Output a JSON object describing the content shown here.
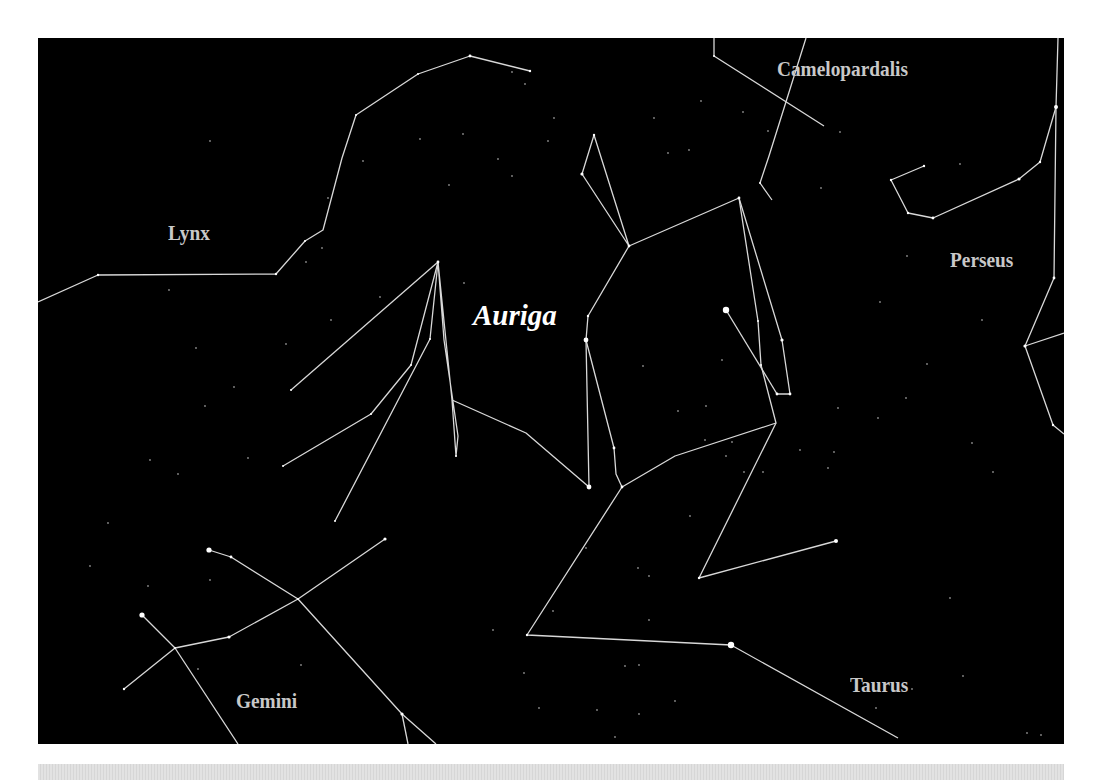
{
  "figure": {
    "title": "Auriga",
    "background_color": "#000000",
    "line_color": "#d8d8d8",
    "label_color": "#c8c8c8",
    "main_label_color": "#ffffff"
  },
  "labels": {
    "auriga": "Auriga",
    "lynx": "Lynx",
    "camelopardalis": "Camelopardalis",
    "perseus": "Perseus",
    "gemini": "Gemini",
    "taurus": "Taurus"
  },
  "label_positions": {
    "auriga": {
      "x": 435,
      "y": 263
    },
    "lynx": {
      "x": 130,
      "y": 185
    },
    "camelopardalis": {
      "x": 739,
      "y": 21
    },
    "perseus": {
      "x": 912,
      "y": 212
    },
    "gemini": {
      "x": 198,
      "y": 653
    },
    "taurus": {
      "x": 812,
      "y": 637
    }
  },
  "constellations": [
    {
      "name": "Lynx",
      "lines": [
        [
          [
            0,
            264
          ],
          [
            60,
            237
          ],
          [
            238,
            236
          ],
          [
            267,
            203
          ],
          [
            285,
            192
          ],
          [
            304,
            120
          ],
          [
            318,
            77
          ],
          [
            380,
            36
          ],
          [
            432,
            18
          ],
          [
            492,
            33
          ]
        ]
      ],
      "stars": [
        [
          60,
          237,
          1.2
        ],
        [
          238,
          236,
          1.2
        ],
        [
          267,
          203,
          1.0
        ],
        [
          318,
          77,
          1.0
        ],
        [
          380,
          36,
          1.0
        ],
        [
          432,
          18,
          1.4
        ],
        [
          492,
          33,
          1.2
        ]
      ]
    },
    {
      "name": "Auriga",
      "lines": [
        [
          [
            550,
            278
          ],
          [
            591,
            208
          ],
          [
            701,
            160
          ],
          [
            720,
            283
          ],
          [
            723,
            327
          ],
          [
            738,
            385
          ],
          [
            637,
            418
          ],
          [
            584,
            449
          ]
        ],
        [
          [
            591,
            208
          ],
          [
            556,
            97
          ],
          [
            544,
            136
          ],
          [
            591,
            208
          ]
        ],
        [
          [
            701,
            160
          ],
          [
            744,
            302
          ],
          [
            752,
            356
          ],
          [
            739,
            356
          ]
        ],
        [
          [
            688,
            272
          ],
          [
            739,
            356
          ]
        ],
        [
          [
            550,
            278
          ],
          [
            548,
            302
          ],
          [
            551,
            449
          ]
        ],
        [
          [
            548,
            302
          ],
          [
            576,
            410
          ],
          [
            578,
            436
          ],
          [
            584,
            449
          ]
        ],
        [
          [
            584,
            449
          ],
          [
            489,
            597
          ],
          [
            693,
            607
          ],
          [
            860,
            700
          ]
        ],
        [
          [
            738,
            385
          ],
          [
            661,
            540
          ],
          [
            798,
            503
          ]
        ]
      ],
      "stars": [
        [
          688,
          272,
          3.2
        ],
        [
          548,
          302,
          2.4
        ],
        [
          551,
          449,
          2.4
        ],
        [
          693,
          607,
          3.2
        ],
        [
          798,
          503,
          2.0
        ],
        [
          556,
          97,
          1.2
        ],
        [
          544,
          136,
          1.6
        ],
        [
          591,
          208,
          1.4
        ],
        [
          701,
          160,
          1.4
        ],
        [
          744,
          302,
          1.6
        ],
        [
          752,
          356,
          1.4
        ],
        [
          739,
          356,
          1.4
        ],
        [
          576,
          410,
          1.4
        ],
        [
          584,
          449,
          1.4
        ],
        [
          489,
          597,
          1.2
        ],
        [
          661,
          540,
          1.2
        ],
        [
          550,
          278,
          1.2
        ],
        [
          720,
          283,
          1.0
        ],
        [
          723,
          327,
          1.0
        ]
      ]
    },
    {
      "name": "Auriga-west-rays",
      "lines": [
        [
          [
            400,
            224
          ],
          [
            253,
            352
          ]
        ],
        [
          [
            400,
            224
          ],
          [
            373,
            327
          ],
          [
            333,
            376
          ],
          [
            245,
            428
          ]
        ],
        [
          [
            400,
            224
          ],
          [
            392,
            301
          ],
          [
            297,
            483
          ]
        ],
        [
          [
            400,
            224
          ],
          [
            414,
            362
          ],
          [
            418,
            418
          ],
          [
            420,
            398
          ],
          [
            406,
            302
          ],
          [
            400,
            224
          ]
        ],
        [
          [
            414,
            362
          ],
          [
            488,
            395
          ],
          [
            551,
            449
          ]
        ]
      ],
      "stars": [
        [
          400,
          224,
          1.4
        ],
        [
          253,
          352,
          1.0
        ],
        [
          245,
          428,
          1.0
        ],
        [
          297,
          483,
          1.0
        ],
        [
          373,
          327,
          1.0
        ],
        [
          333,
          376,
          1.0
        ],
        [
          392,
          301,
          1.0
        ],
        [
          418,
          418,
          1.0
        ]
      ]
    },
    {
      "name": "Camelopardalis",
      "lines": [
        [
          [
            676,
            0
          ],
          [
            676,
            18
          ],
          [
            786,
            88
          ]
        ],
        [
          [
            768,
            0
          ],
          [
            731,
            118
          ],
          [
            722,
            145
          ],
          [
            734,
            162
          ]
        ]
      ],
      "stars": [
        [
          676,
          18,
          1.0
        ],
        [
          722,
          145,
          1.0
        ]
      ]
    },
    {
      "name": "Perseus",
      "lines": [
        [
          [
            1020,
            0
          ],
          [
            1018,
            69
          ],
          [
            1002,
            124
          ],
          [
            981,
            141
          ],
          [
            895,
            180
          ],
          [
            870,
            175
          ],
          [
            853,
            142
          ],
          [
            886,
            128
          ]
        ],
        [
          [
            1018,
            69
          ],
          [
            1016,
            240
          ],
          [
            987,
            308
          ],
          [
            1026,
            295
          ]
        ],
        [
          [
            987,
            308
          ],
          [
            1015,
            387
          ],
          [
            1026,
            396
          ]
        ]
      ],
      "stars": [
        [
          1018,
          69,
          2.0
        ],
        [
          981,
          141,
          1.6
        ],
        [
          1002,
          124,
          1.2
        ],
        [
          895,
          180,
          1.4
        ],
        [
          870,
          175,
          1.2
        ],
        [
          853,
          142,
          1.2
        ],
        [
          886,
          128,
          1.2
        ],
        [
          1016,
          240,
          1.4
        ],
        [
          987,
          308,
          1.6
        ],
        [
          1015,
          387,
          1.2
        ]
      ]
    },
    {
      "name": "Gemini",
      "lines": [
        [
          [
            171,
            512
          ],
          [
            193,
            519
          ],
          [
            260,
            561
          ],
          [
            347,
            501
          ]
        ],
        [
          [
            104,
            577
          ],
          [
            137,
            610
          ],
          [
            191,
            599
          ],
          [
            260,
            561
          ],
          [
            364,
            676
          ],
          [
            398,
            706
          ]
        ],
        [
          [
            137,
            610
          ],
          [
            86,
            651
          ]
        ],
        [
          [
            137,
            610
          ],
          [
            200,
            706
          ]
        ],
        [
          [
            364,
            676
          ],
          [
            370,
            706
          ]
        ]
      ],
      "stars": [
        [
          171,
          512,
          2.6
        ],
        [
          104,
          577,
          2.6
        ],
        [
          193,
          519,
          1.4
        ],
        [
          347,
          501,
          1.6
        ],
        [
          191,
          599,
          1.6
        ],
        [
          86,
          651,
          1.2
        ],
        [
          364,
          676,
          1.6
        ],
        [
          260,
          561,
          1.0
        ],
        [
          137,
          610,
          1.0
        ]
      ]
    }
  ],
  "field_stars": [
    [
      172,
      103
    ],
    [
      131,
      252
    ],
    [
      284,
      210
    ],
    [
      290,
      160
    ],
    [
      474,
      34
    ],
    [
      487,
      46
    ],
    [
      516,
      80
    ],
    [
      425,
      96
    ],
    [
      382,
      101
    ],
    [
      474,
      138
    ],
    [
      411,
      147
    ],
    [
      325,
      123
    ],
    [
      293,
      282
    ],
    [
      268,
      224
    ],
    [
      510,
      103
    ],
    [
      460,
      121
    ],
    [
      426,
      245
    ],
    [
      342,
      259
    ],
    [
      248,
      306
    ],
    [
      630,
      115
    ],
    [
      651,
      112
    ],
    [
      705,
      74
    ],
    [
      730,
      93
    ],
    [
      663,
      63
    ],
    [
      616,
      80
    ],
    [
      802,
      94
    ],
    [
      869,
      218
    ],
    [
      922,
      126
    ],
    [
      842,
      264
    ],
    [
      944,
      282
    ],
    [
      889,
      326
    ],
    [
      868,
      360
    ],
    [
      934,
      405
    ],
    [
      800,
      370
    ],
    [
      840,
      380
    ],
    [
      783,
      150
    ],
    [
      158,
      310
    ],
    [
      196,
      349
    ],
    [
      167,
      368
    ],
    [
      112,
      422
    ],
    [
      140,
      436
    ],
    [
      210,
      420
    ],
    [
      70,
      485
    ],
    [
      110,
      548
    ],
    [
      172,
      542
    ],
    [
      52,
      528
    ],
    [
      160,
      631
    ],
    [
      263,
      627
    ],
    [
      239,
      723
    ],
    [
      605,
      328
    ],
    [
      640,
      373
    ],
    [
      668,
      368
    ],
    [
      684,
      322
    ],
    [
      706,
      434
    ],
    [
      667,
      402
    ],
    [
      694,
      404
    ],
    [
      725,
      434
    ],
    [
      688,
      418
    ],
    [
      762,
      412
    ],
    [
      796,
      414
    ],
    [
      790,
      430
    ],
    [
      955,
      434
    ],
    [
      912,
      560
    ],
    [
      925,
      638
    ],
    [
      874,
      651
    ],
    [
      838,
      670
    ],
    [
      989,
      695
    ],
    [
      1003,
      697
    ],
    [
      548,
      510
    ],
    [
      611,
      538
    ],
    [
      600,
      530
    ],
    [
      652,
      478
    ],
    [
      601,
      627
    ],
    [
      587,
      628
    ],
    [
      559,
      672
    ],
    [
      601,
      676
    ],
    [
      637,
      663
    ],
    [
      501,
      670
    ],
    [
      577,
      699
    ],
    [
      455,
      592
    ],
    [
      486,
      635
    ],
    [
      515,
      573
    ],
    [
      611,
      582
    ]
  ]
}
